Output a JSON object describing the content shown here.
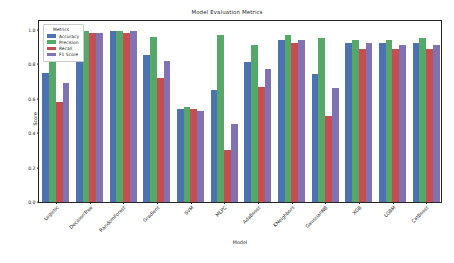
{
  "chart_data": {
    "type": "bar",
    "title": "Model Evaluation Metrics",
    "xlabel": "Model",
    "ylabel": "Score",
    "ylim": [
      0.0,
      1.05
    ],
    "yticks": [
      "0.0",
      "0.2",
      "0.4",
      "0.6",
      "0.8",
      "1.0"
    ],
    "ytick_values": [
      0.0,
      0.2,
      0.4,
      0.6,
      0.8,
      1.0
    ],
    "grid": false,
    "legend_title": "Metrics",
    "legend_position": "upper left",
    "categories": [
      "Logistic",
      "DecisionTree",
      "RandomForest",
      "Gradient",
      "SVM",
      "MLPC",
      "AdaBoost",
      "KNeighbors",
      "GaussianNB",
      "XGB",
      "LGBM",
      "CatBoost"
    ],
    "series": [
      {
        "name": "Accuracy",
        "color": "#4c72b0",
        "values": [
          0.75,
          0.99,
          0.99,
          0.85,
          0.54,
          0.65,
          0.81,
          0.94,
          0.74,
          0.92,
          0.92,
          0.92
        ]
      },
      {
        "name": "Precision",
        "color": "#55a868",
        "values": [
          0.93,
          0.99,
          0.99,
          0.96,
          0.55,
          0.97,
          0.91,
          0.97,
          0.95,
          0.94,
          0.94,
          0.95
        ]
      },
      {
        "name": "Recall",
        "color": "#c44e52",
        "values": [
          0.58,
          0.98,
          0.98,
          0.72,
          0.54,
          0.3,
          0.67,
          0.92,
          0.5,
          0.89,
          0.89,
          0.89
        ]
      },
      {
        "name": "F1 Score",
        "color": "#8172b2",
        "values": [
          0.69,
          0.98,
          0.99,
          0.82,
          0.53,
          0.45,
          0.77,
          0.94,
          0.66,
          0.92,
          0.91,
          0.91
        ]
      }
    ]
  }
}
